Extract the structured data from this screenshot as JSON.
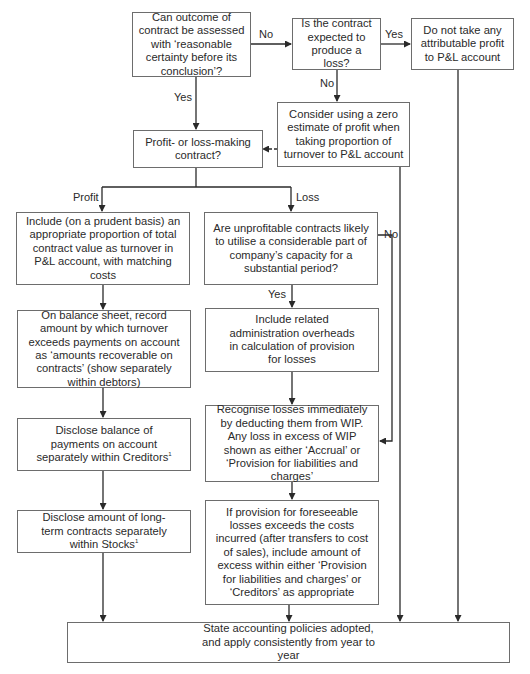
{
  "diagram": {
    "type": "flowchart",
    "nodes": {
      "q_outcome": {
        "text": "Can outcome of contract be assessed with ‘reasonable certainty before its conclusion’?"
      },
      "q_loss": {
        "text": "Is the contract expected to produce a loss?"
      },
      "no_profit": {
        "text": "Do not take any attributable profit to P&L account"
      },
      "zero_estimate": {
        "text": "Consider using a zero estimate of profit when taking proportion of turnover to P&L account"
      },
      "q_profit_loss": {
        "text": "Profit- or loss-making contract?"
      },
      "include_prudent": {
        "text": "Include (on a prudent basis) an appropriate proportion of total contract value as turnover in P&L account, with matching costs"
      },
      "q_capacity": {
        "text": "Are unprofitable contracts likely to utilise a considerable part of company’s capacity for a substantial period?"
      },
      "balance_sheet": {
        "text": "On balance sheet, record amount by which turnover exceeds payments on account as ‘amounts recoverable on contracts’ (show separately within debtors)"
      },
      "include_overheads": {
        "text": "Include related administration overheads in calculation of provision for losses"
      },
      "disclose_payments": {
        "text": "Disclose balance of payments on account separately within Creditors",
        "footnote": "1"
      },
      "recognise_losses": {
        "text": "Recognise losses immediately by deducting them from WIP. Any loss in excess of WIP shown as either ‘Accrual’ or ‘Provision for liabilities and charges’"
      },
      "disclose_longterm": {
        "text": "Disclose amount of long-term contracts separately within Stocks",
        "footnote": "1"
      },
      "provision_excess": {
        "text": "If provision for foreseeable losses exceeds the costs incurred (after transfers to cost of sales), include amount of excess within either ‘Provision for liabilities and charges’ or ‘Creditors’ as appropriate"
      },
      "state_policies": {
        "text": "State accounting policies adopted, and apply consistently from year to year"
      }
    },
    "edge_labels": {
      "outcome_no": "No",
      "outcome_yes": "Yes",
      "loss_yes": "Yes",
      "loss_no": "No",
      "profit": "Profit",
      "loss": "Loss",
      "capacity_yes": "Yes",
      "capacity_no": "No"
    },
    "edges": [
      {
        "from": "q_outcome",
        "to": "q_loss",
        "label": "No"
      },
      {
        "from": "q_outcome",
        "to": "q_profit_loss",
        "label": "Yes"
      },
      {
        "from": "q_loss",
        "to": "no_profit",
        "label": "Yes"
      },
      {
        "from": "q_loss",
        "to": "zero_estimate",
        "label": "No"
      },
      {
        "from": "zero_estimate",
        "to": "q_profit_loss",
        "style": "dashed"
      },
      {
        "from": "q_profit_loss",
        "to": "include_prudent",
        "label": "Profit"
      },
      {
        "from": "q_profit_loss",
        "to": "q_capacity",
        "label": "Loss"
      },
      {
        "from": "include_prudent",
        "to": "balance_sheet"
      },
      {
        "from": "balance_sheet",
        "to": "disclose_payments"
      },
      {
        "from": "disclose_payments",
        "to": "disclose_longterm"
      },
      {
        "from": "disclose_longterm",
        "to": "state_policies"
      },
      {
        "from": "q_capacity",
        "to": "include_overheads",
        "label": "Yes"
      },
      {
        "from": "q_capacity",
        "to": "recognise_losses",
        "label": "No"
      },
      {
        "from": "include_overheads",
        "to": "recognise_losses"
      },
      {
        "from": "recognise_losses",
        "to": "provision_excess"
      },
      {
        "from": "provision_excess",
        "to": "state_policies"
      },
      {
        "from": "zero_estimate",
        "to": "state_policies"
      },
      {
        "from": "no_profit",
        "to": "state_policies"
      }
    ],
    "colors": {
      "line": "#2a2a2a",
      "border": "#6d6d6d",
      "background": "#ffffff",
      "text": "#2a2a2a"
    }
  }
}
